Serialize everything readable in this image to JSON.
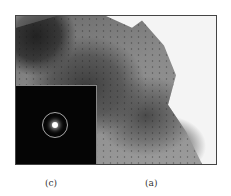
{
  "figure": {
    "header_text": "",
    "panels": [
      {
        "id": "a",
        "caption": "(a)",
        "description": "TEM bright-field micrograph of sample flake"
      },
      {
        "id": "c",
        "caption": "(c)",
        "description": "Selected area electron diffraction pattern inset with central spot and ring"
      }
    ]
  }
}
